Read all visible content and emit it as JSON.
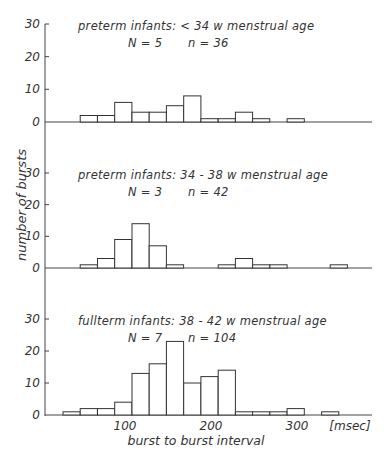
{
  "chart_data": {
    "type": "bar",
    "subtype": "histogram",
    "ylabel": "number of bursts",
    "xlabel": "burst to burst interval",
    "x_unit": "[msec]",
    "x_ticks": [
      100,
      200,
      300
    ],
    "y_ticks": [
      0,
      10,
      20,
      30
    ],
    "ylim": [
      0,
      30
    ],
    "bin_width_msec": 20,
    "grid": false,
    "panels": [
      {
        "title": "preterm infants:  < 34 w  menstrual age",
        "N_label": "N = 5",
        "n_label": "n = 36",
        "bin_starts_msec": [
          50,
          70,
          90,
          110,
          130,
          150,
          170,
          190,
          210,
          230,
          250,
          270,
          290
        ],
        "values": [
          2,
          2,
          6,
          3,
          3,
          5,
          8,
          1,
          1,
          3,
          1,
          0,
          1
        ]
      },
      {
        "title": "preterm infants: 34 - 38 w  menstrual age",
        "N_label": "N = 3",
        "n_label": "n = 42",
        "bin_starts_msec": [
          50,
          70,
          90,
          110,
          130,
          150,
          170,
          190,
          210,
          230,
          250,
          270,
          290,
          310
        ],
        "values": [
          1,
          3,
          9,
          14,
          7,
          1,
          0,
          0,
          1,
          3,
          1,
          1,
          0,
          0
        ],
        "extra_bins": [
          {
            "start": 340,
            "value": 1
          }
        ]
      },
      {
        "title": "fullterm infants: 38 - 42 w  menstrual age",
        "N_label": "N = 7",
        "n_label": "n = 104",
        "bin_starts_msec": [
          30,
          50,
          70,
          90,
          110,
          130,
          150,
          170,
          190,
          210,
          230,
          250,
          270,
          290,
          310,
          330
        ],
        "values": [
          1,
          2,
          2,
          4,
          13,
          16,
          23,
          10,
          12,
          14,
          1,
          1,
          1,
          2,
          0,
          1
        ]
      }
    ]
  }
}
